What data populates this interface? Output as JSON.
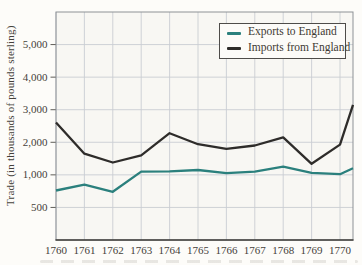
{
  "figure": {
    "y_axis_title": "Trade (in thousands of pounds sterling)",
    "background_color": "#fdfcf9",
    "plot_background_color": "#f8f7f3",
    "grid_color": "#c9cdd2",
    "plot_border_color": "#8e9196",
    "axis_line_color": "#3e3c38",
    "tick_color": "#5f5d58",
    "text_color": "#45413a"
  },
  "chart_data": {
    "type": "line",
    "title": "",
    "xlabel": "",
    "ylabel": "Trade (in thousands of pounds sterling)",
    "grid": true,
    "legend_position": "top-right-inside",
    "x": [
      1760,
      1761,
      1762,
      1763,
      1764,
      1765,
      1766,
      1767,
      1768,
      1769,
      1770
    ],
    "y_ticks": [
      500,
      1000,
      2000,
      3000,
      4000,
      5000
    ],
    "y_tick_labels": [
      "500",
      "1,000",
      "2,000",
      "3,000",
      "4,000",
      "5,000"
    ],
    "y_scale_note": "non-linear scan-style scale: gridlines 0,500,1000,2000,3000,4000,5000 are equally spaced; top headroom equals one gridline step",
    "ylim": [
      0,
      5000
    ],
    "right_edge": {
      "years_past_last_tick": 0.46,
      "note": "both lines continue past 1770 and are clipped at the plot's right border"
    },
    "series": [
      {
        "name": "Exports to England",
        "color": "#2b807d",
        "values": [
          760,
          850,
          740,
          1100,
          1110,
          1150,
          1050,
          1100,
          1250,
          1060,
          1020
        ],
        "value_at_right_edge": 1200
      },
      {
        "name": "Imports from England",
        "color": "#2e2c2a",
        "values": [
          2610,
          1650,
          1380,
          1600,
          2280,
          1940,
          1800,
          1900,
          2150,
          1340,
          1930
        ],
        "value_at_right_edge": 3150
      }
    ]
  }
}
